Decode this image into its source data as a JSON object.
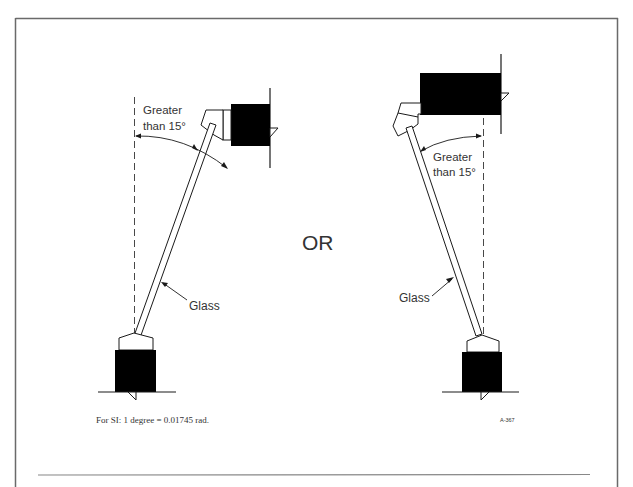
{
  "figure": {
    "id_label": "A-367",
    "separator_word": "OR",
    "footnote": "For SI: 1 degree = 0.01745 rad.",
    "left_diagram": {
      "angle_label_line1": "Greater",
      "angle_label_line2": "than 15°",
      "glass_label": "Glass"
    },
    "right_diagram": {
      "angle_label_line1": "Greater",
      "angle_label_line2": "than 15°",
      "glass_label": "Glass"
    }
  },
  "colors": {
    "frame": "#666666",
    "ink": "#1a1a1a",
    "fill_dark": "#000000",
    "background": "#ffffff"
  }
}
